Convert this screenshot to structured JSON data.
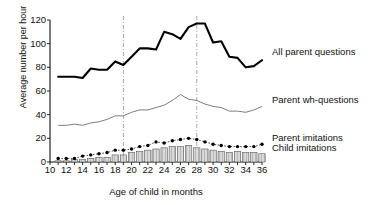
{
  "chart_data": {
    "type": "line",
    "title": "",
    "xlabel": "Age of child in months",
    "ylabel": "Average number per hour",
    "xlim": [
      10,
      36
    ],
    "ylim": [
      0,
      120
    ],
    "yticks": [
      0,
      20,
      40,
      60,
      80,
      100,
      120
    ],
    "xticks": [
      10,
      12,
      14,
      16,
      18,
      20,
      22,
      24,
      26,
      28,
      30,
      32,
      34,
      36
    ],
    "xtick_labels": [
      "10",
      "12",
      "14",
      "16",
      "18",
      "20",
      "22",
      "24",
      "26",
      "28",
      "30",
      "32",
      "34",
      "36"
    ],
    "ytick_labels": [
      "0",
      "20",
      "40",
      "60",
      "80",
      "100",
      "120"
    ],
    "grid": false,
    "legend_position": "right",
    "x": [
      11,
      12,
      13,
      14,
      15,
      16,
      17,
      18,
      19,
      20,
      21,
      22,
      23,
      24,
      25,
      26,
      27,
      28,
      29,
      30,
      31,
      32,
      33,
      34,
      35,
      36
    ],
    "series": [
      {
        "name": "All parent questions",
        "style": "thick-line",
        "color": "#000000",
        "values": [
          72,
          72,
          72,
          71,
          79,
          78,
          78,
          85,
          82,
          89,
          96,
          96,
          95,
          110,
          108,
          104,
          114,
          117,
          117,
          101,
          102,
          89,
          88,
          80,
          81,
          86
        ]
      },
      {
        "name": "Parent wh-questions",
        "style": "thin-line",
        "color": "#6e6e6e",
        "values": [
          31,
          31,
          32,
          31,
          33,
          34,
          36,
          39,
          39,
          42,
          44,
          44,
          46,
          48,
          52,
          57,
          53,
          52,
          49,
          47,
          46,
          43,
          43,
          42,
          44,
          47
        ]
      },
      {
        "name": "Parent imitations",
        "style": "dotted-markers",
        "color": "#000000",
        "values": [
          3,
          3,
          3,
          5,
          6,
          7,
          8,
          10,
          10,
          11,
          13,
          14,
          17,
          16,
          18,
          19,
          20,
          19,
          17,
          15,
          14,
          13,
          13,
          13,
          13,
          15
        ]
      },
      {
        "name": "Child imitations",
        "style": "hatched-bars",
        "color": "#b4b4b4",
        "values": [
          1,
          1,
          2,
          2,
          3,
          4,
          4,
          6,
          6,
          8,
          9,
          10,
          11,
          12,
          13,
          13,
          14,
          12,
          11,
          10,
          9,
          8,
          9,
          8,
          8,
          7
        ]
      }
    ],
    "vlines": [
      19,
      28
    ],
    "vline_style": "dash-dot",
    "vline_color": "#aaaaaa"
  },
  "legend": {
    "all_parent_questions": "All parent questions",
    "parent_wh_questions": "Parent wh-questions",
    "parent_imitations": "Parent imitations",
    "child_imitations": "Child imitations"
  }
}
